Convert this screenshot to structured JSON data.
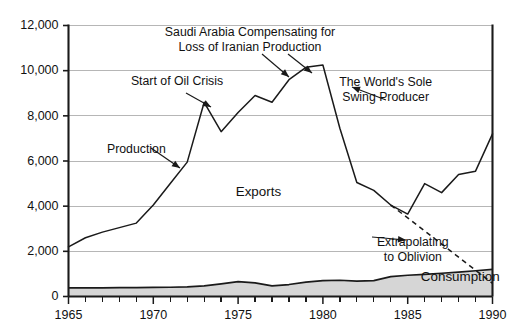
{
  "chart_data": {
    "type": "line",
    "title": "",
    "subtitle": "",
    "xlabel": "",
    "ylabel": "",
    "xlim": [
      1965,
      1990
    ],
    "ylim": [
      0,
      12000
    ],
    "grid": true,
    "legend_position": "inline-annotations",
    "yticks": [
      0,
      2000,
      4000,
      6000,
      8000,
      10000,
      12000
    ],
    "ytick_labels": [
      "0",
      "2,000",
      "4,000",
      "6,000",
      "8,000",
      "10,000",
      "12,000"
    ],
    "xticks": [
      1965,
      1970,
      1975,
      1980,
      1985,
      1990
    ],
    "xtick_labels": [
      "1965",
      "1970",
      "1975",
      "1980",
      "1985",
      "1990"
    ],
    "xtick_minor_step": 1,
    "series": [
      {
        "name": "Exports",
        "style": "solid",
        "x": [
          1965,
          1966,
          1967,
          1968,
          1969,
          1970,
          1971,
          1972,
          1973,
          1974,
          1975,
          1976,
          1977,
          1978,
          1979,
          1980,
          1981,
          1982,
          1983,
          1984,
          1985,
          1986,
          1987,
          1988,
          1989,
          1990
        ],
        "values": [
          2200,
          2600,
          2850,
          3050,
          3250,
          4050,
          5000,
          5950,
          8600,
          7300,
          8150,
          8900,
          8600,
          9600,
          10150,
          10250,
          7450,
          5050,
          4700,
          4050,
          3650,
          5000,
          4600,
          5400,
          5550,
          7200
        ]
      },
      {
        "name": "Extrapolating to Oblivion",
        "style": "dashed",
        "x": [
          1984,
          1985,
          1986,
          1987,
          1988,
          1989,
          1990
        ],
        "values": [
          4050,
          3480,
          2900,
          2320,
          1740,
          1160,
          580
        ]
      },
      {
        "name": "Consumption",
        "style": "area",
        "x": [
          1965,
          1966,
          1967,
          1968,
          1969,
          1970,
          1971,
          1972,
          1973,
          1974,
          1975,
          1976,
          1977,
          1978,
          1979,
          1980,
          1981,
          1982,
          1983,
          1984,
          1985,
          1986,
          1987,
          1988,
          1989,
          1990
        ],
        "values": [
          380,
          380,
          385,
          390,
          395,
          400,
          410,
          430,
          470,
          560,
          660,
          600,
          470,
          530,
          640,
          700,
          720,
          680,
          700,
          880,
          940,
          980,
          1030,
          1080,
          1140,
          1200
        ]
      }
    ],
    "annotations": [
      {
        "id": "production",
        "text": "Production",
        "lines": [
          "Production"
        ],
        "x": 1969.0,
        "y": 6350
      },
      {
        "id": "oil-crisis",
        "text": "Start of Oil Crisis",
        "lines": [
          "Start of Oil Crisis"
        ],
        "x": 1971.4,
        "y": 9350
      },
      {
        "id": "saudi",
        "text": "Saudi Arabia Compensating for Loss of Iranian Production",
        "lines": [
          "Saudi Arabia Compensating for",
          "Loss of Iranian Production"
        ],
        "x": 1975.7,
        "y": 11550
      },
      {
        "id": "swing-producer",
        "text": "The World's Sole Swing Producer",
        "lines": [
          "The World's Sole",
          "Swing Producer"
        ],
        "x": 1983.7,
        "y": 9300
      },
      {
        "id": "exports-label",
        "text": "Exports",
        "lines": [
          "Exports"
        ],
        "x": 1976.2,
        "y": 4450
      },
      {
        "id": "extrapolating",
        "text": "Extrapolating to Oblivion",
        "lines": [
          "Extrapolating",
          "to Oblivion"
        ],
        "x": 1985.3,
        "y": 2250
      },
      {
        "id": "consumption-label",
        "text": "Consumption",
        "lines": [
          "Consumption"
        ],
        "x": 1988.1,
        "y": 700
      }
    ]
  },
  "colors": {
    "line": "#1a1a1a",
    "grid": "#b6b6b6",
    "area_fill": "#d6d6d6",
    "axis": "#1a1a1a",
    "text": "#111111",
    "background": "#ffffff"
  }
}
